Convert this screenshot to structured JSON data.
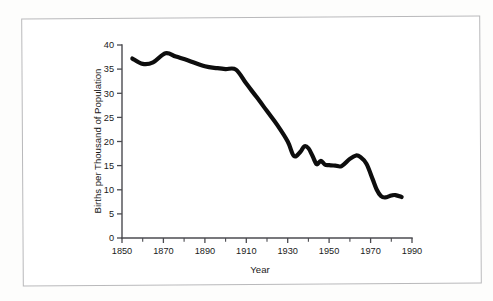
{
  "figure": {
    "frame_color": "#b9b9bb",
    "background_color": "#ffffff",
    "line_color": "#0d0d0d",
    "axis_color": "#4b4b50"
  },
  "chart_data": {
    "type": "line",
    "title": "",
    "subtitle": "",
    "xlabel": "Year",
    "ylabel": "Births per Thousand of Population",
    "xlim": [
      1850,
      1990
    ],
    "ylim": [
      0,
      40
    ],
    "x_ticks": [
      1850,
      1870,
      1890,
      1910,
      1930,
      1950,
      1970,
      1990
    ],
    "x_tick_labels": [
      "1850",
      "1870",
      "1890",
      "1910",
      "1930",
      "1950",
      "1970",
      "1990"
    ],
    "x_minor_ticks": [
      1860,
      1880,
      1900,
      1920,
      1940,
      1960,
      1980
    ],
    "y_ticks": [
      0,
      5,
      10,
      15,
      20,
      25,
      30,
      35,
      40
    ],
    "y_tick_labels": [
      "0",
      "5",
      "10",
      "15",
      "20",
      "25",
      "30",
      "35",
      "40"
    ],
    "grid": false,
    "legend": false,
    "legend_position": "none",
    "series": [
      {
        "name": "Births per Thousand of Population",
        "x": [
          1855,
          1860,
          1865,
          1871,
          1876,
          1882,
          1890,
          1896,
          1900,
          1905,
          1910,
          1915,
          1920,
          1925,
          1930,
          1933,
          1936,
          1938,
          1940,
          1942,
          1944,
          1946,
          1948,
          1950,
          1953,
          1956,
          1960,
          1963,
          1965,
          1968,
          1971,
          1973,
          1975,
          1977,
          1980,
          1982,
          1985
        ],
        "y": [
          37.2,
          36.1,
          36.4,
          38.3,
          37.6,
          36.8,
          35.6,
          35.2,
          35.0,
          34.9,
          32.0,
          29.2,
          26.3,
          23.4,
          20.0,
          17.0,
          17.8,
          19.0,
          18.6,
          17.0,
          15.3,
          16.0,
          15.2,
          15.1,
          15.0,
          14.9,
          16.4,
          17.1,
          16.8,
          15.4,
          12.2,
          10.0,
          8.7,
          8.4,
          8.8,
          8.9,
          8.5
        ]
      }
    ]
  }
}
